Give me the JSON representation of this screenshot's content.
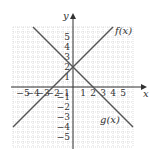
{
  "chart_data": {
    "type": "line",
    "title": "",
    "xlabel": "x",
    "ylabel": "y",
    "xlim": [
      -6,
      6
    ],
    "ylim": [
      -6,
      6
    ],
    "grid": true,
    "x_ticks": [
      -5,
      -4,
      -3,
      -2,
      -1,
      1,
      2,
      3,
      4,
      5
    ],
    "y_ticks": [
      5,
      4,
      3,
      2,
      1,
      -1,
      -2,
      -3,
      -4,
      -5
    ],
    "x_tick_labels": [
      "−5",
      "−4",
      "−3",
      "−2",
      "−1",
      "1",
      "2",
      "3",
      "4",
      "5"
    ],
    "y_tick_labels": [
      "5",
      "4",
      "3",
      "2",
      "1",
      "−1",
      "−2",
      "−3",
      "−4",
      "−5"
    ],
    "series": [
      {
        "name": "f(x)",
        "label": "f(x)",
        "equation": "y = x + 2",
        "points": [
          [
            -6,
            -4
          ],
          [
            4,
            6
          ]
        ],
        "color": "#555555"
      },
      {
        "name": "g(x)",
        "label": "g(x)",
        "equation": "y = -x + 2",
        "points": [
          [
            -4,
            6
          ],
          [
            6,
            -4
          ]
        ],
        "color": "#555555"
      }
    ]
  }
}
